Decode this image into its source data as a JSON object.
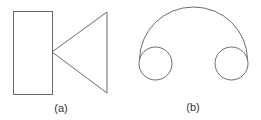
{
  "figures": [
    {
      "id": "a",
      "label": "(a)",
      "description": "Rectangle with triangle whose apex touches the rectangle's right edge midpoint",
      "shapes": {
        "rectangle": {
          "x": 13,
          "y": 11,
          "width": 39,
          "height": 83
        },
        "triangle": {
          "points": "52,52 107,12 107,93"
        }
      },
      "label_pos": {
        "x": 61,
        "y": 112
      }
    },
    {
      "id": "b",
      "label": "(b)",
      "description": "Two small circles connected by a large semicircular arc over the top",
      "shapes": {
        "arc": {
          "path": "M 139.5 60 A 54 53 0 0 1 247.5 60"
        },
        "left_circle": {
          "cx": 155.5,
          "cy": 63.5,
          "r": 16.5
        },
        "right_circle": {
          "cx": 231.5,
          "cy": 63.5,
          "r": 16.5
        }
      },
      "label_pos": {
        "x": 193,
        "y": 111
      }
    }
  ],
  "colors": {
    "stroke": "#6b6b6b",
    "label": "#333333",
    "background": "#ffffff"
  }
}
